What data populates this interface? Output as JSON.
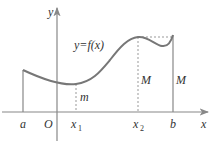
{
  "diagram": {
    "title": "",
    "function_label": "y=f(x)",
    "axes": {
      "x_label": "x",
      "y_label": "y",
      "origin_label": "O"
    },
    "points": {
      "a": "a",
      "x1": "x",
      "x1_sub": "1",
      "x2": "x",
      "x2_sub": "2",
      "b": "b"
    },
    "annotations": {
      "min_label": "m",
      "max_label_inner": "M",
      "max_label_right": "M"
    },
    "colors": {
      "curve": "#777777",
      "axis": "#888888",
      "text": "#333333"
    }
  }
}
